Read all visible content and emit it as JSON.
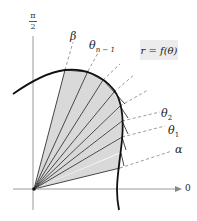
{
  "diagram": {
    "type": "polar-area-sectors",
    "axis_labels": {
      "vertical_top_numerator": "π",
      "vertical_top_denominator": "2",
      "horizontal_right": "0"
    },
    "curve_label": "r = f(θ)",
    "ray_labels": {
      "beta": "β",
      "theta_n_minus_1_main": "θ",
      "theta_n_minus_1_sub": "n − 1",
      "theta_2_main": "θ",
      "theta_2_sub": "2",
      "theta_1_main": "θ",
      "theta_1_sub": "1",
      "alpha": "α"
    },
    "colors": {
      "sector_fill": "#d9d9d9",
      "curve": "#111111",
      "rays": "#333333",
      "dashed": "#9a9a9a",
      "axis": "#999999",
      "label_box": "#ececec"
    },
    "sector_count": 8
  }
}
